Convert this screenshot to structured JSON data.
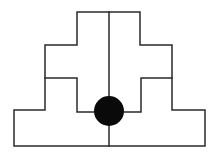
{
  "diagram": {
    "type": "symmetric stepped pyramid outline divided into two halves with a central black dot",
    "stroke_color": "#2a2a2a",
    "fill_color": "#ffffff",
    "dot_color": "#0a0a0a",
    "outline_points": "77,12 140,12 140,45 172,45 172,110 205,110 205,146 14,146 14,110 45,110 45,45 77,45 77,12",
    "center_line": {
      "x1": 109,
      "y1": 12,
      "x2": 109,
      "y2": 146
    },
    "left_inner_path": "45,78 77,78 77,112 94,112",
    "right_inner_path": "172,78 141,78 141,112 124,112",
    "dot": {
      "cx": 109,
      "cy": 111,
      "r": 15
    },
    "labels": []
  }
}
